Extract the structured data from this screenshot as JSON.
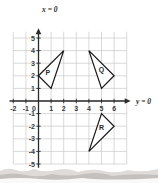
{
  "chart_data": {
    "type": "scatter",
    "title": "",
    "subtitle": "",
    "xlabel": "y = 0",
    "ylabel": "x = 0",
    "xlim": [
      -2.4,
      7.2
    ],
    "ylim": [
      -5.6,
      5.8
    ],
    "grid": true,
    "legend_position": "none",
    "x_ticks": [
      -2,
      -1,
      0,
      1,
      2,
      3,
      4,
      5,
      6
    ],
    "x_tick_labels": [
      "-2",
      "-1",
      "0",
      "1",
      "2",
      "3",
      "4",
      "5",
      "6"
    ],
    "y_ticks": [
      5,
      4,
      3,
      2,
      1,
      -1,
      -2,
      -3,
      -4,
      -5
    ],
    "y_tick_labels": [
      "5",
      "4",
      "3",
      "2",
      "1",
      "-1",
      "-2",
      "-3",
      "-4",
      "-5"
    ],
    "axis_label_x": "y = 0",
    "axis_label_y": "x = 0",
    "shapes": [
      {
        "name": "P",
        "label": "P",
        "vertices": [
          [
            0,
            2
          ],
          [
            2,
            4
          ],
          [
            1,
            1
          ]
        ],
        "label_position": [
          0.75,
          2.1
        ]
      },
      {
        "name": "Q",
        "label": "Q",
        "vertices": [
          [
            4,
            4
          ],
          [
            6,
            2
          ],
          [
            5,
            1
          ]
        ],
        "label_position": [
          5.0,
          2.3
        ]
      },
      {
        "name": "R",
        "label": "R",
        "vertices": [
          [
            5,
            -1
          ],
          [
            6,
            -2
          ],
          [
            4,
            -4
          ]
        ],
        "label_position": [
          5.0,
          -2.3
        ]
      }
    ],
    "colors": {
      "grid": "#c9c9c9",
      "axis": "#2b2b2b",
      "shape_stroke": "#1a1a1a",
      "shape_fill": "#ffffff",
      "background": "#ffffff",
      "tick_label": "#3a3a3a"
    }
  }
}
